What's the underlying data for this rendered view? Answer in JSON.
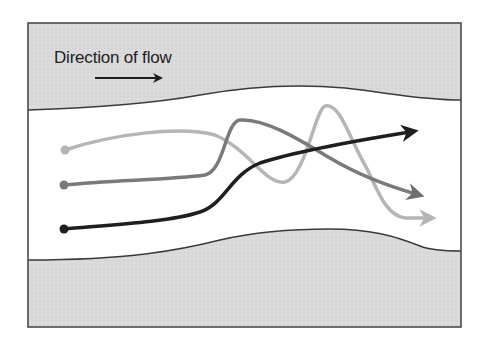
{
  "diagram": {
    "title_label": "Direction of flow",
    "colors": {
      "bank_fill": "#d9d9d9",
      "channel_fill": "#ffffff",
      "border": "#4a4a4a",
      "path_light": "#b5b5b5",
      "path_medium": "#7a7a7a",
      "path_dark": "#1e1e1e"
    },
    "paths": [
      {
        "name": "light-gray-path",
        "start": [
          65,
          150
        ],
        "end": [
          436,
          218
        ]
      },
      {
        "name": "medium-gray-path",
        "start": [
          64,
          185
        ],
        "end": [
          424,
          196
        ]
      },
      {
        "name": "black-path",
        "start": [
          64,
          229
        ],
        "end": [
          418,
          131
        ]
      }
    ]
  }
}
